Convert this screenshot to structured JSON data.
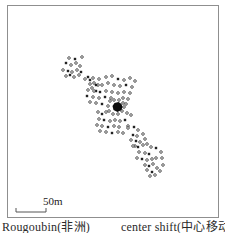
{
  "figure": {
    "caption_left": "Rougoubin(非洲)",
    "caption_right": "center shift(中心移动)",
    "scale_bar": {
      "label": "50m",
      "meters": 50,
      "x": 16,
      "y": 212,
      "length_px": 30,
      "tick_height_px": 4
    }
  },
  "colors": {
    "frame": "#8f8f8f",
    "marker_stroke": "#2e2e2e",
    "marker_fill_solid": "#222222",
    "blob": "#0d0d0d",
    "scalebar": "#555555",
    "text": "#2a2a2a"
  },
  "chart_data": {
    "type": "scatter",
    "title": "",
    "units": "image pixels",
    "marker_types": {
      "o": "open-ring structure",
      "s": "solid structure"
    },
    "center_blob": {
      "x": 117.5,
      "y": 107
    },
    "points": [
      [
        69,
        58,
        "o"
      ],
      [
        75,
        59,
        "s"
      ],
      [
        82,
        57,
        "o"
      ],
      [
        66,
        63,
        "s"
      ],
      [
        71,
        65,
        "o"
      ],
      [
        76,
        63,
        "o"
      ],
      [
        80,
        66,
        "o"
      ],
      [
        63,
        70,
        "o"
      ],
      [
        68,
        71,
        "s"
      ],
      [
        72,
        72,
        "o"
      ],
      [
        77,
        70,
        "o"
      ],
      [
        81,
        72,
        "s"
      ],
      [
        66,
        76,
        "o"
      ],
      [
        70,
        75,
        "s"
      ],
      [
        74,
        77,
        "o"
      ],
      [
        79,
        75,
        "o"
      ],
      [
        85,
        79,
        "o"
      ],
      [
        90,
        80,
        "s"
      ],
      [
        94,
        83,
        "o"
      ],
      [
        98,
        85,
        "o"
      ],
      [
        92,
        88,
        "o"
      ],
      [
        96,
        91,
        "s"
      ],
      [
        88,
        77,
        "s"
      ],
      [
        93,
        78,
        "o"
      ],
      [
        99,
        79,
        "o"
      ],
      [
        106,
        77,
        "o"
      ],
      [
        112,
        76,
        "o"
      ],
      [
        118,
        79,
        "s"
      ],
      [
        124,
        80,
        "o"
      ],
      [
        130,
        78,
        "o"
      ],
      [
        135,
        81,
        "o"
      ],
      [
        90,
        84,
        "o"
      ],
      [
        96,
        85,
        "s"
      ],
      [
        102,
        85,
        "o"
      ],
      [
        108,
        83,
        "o"
      ],
      [
        114,
        85,
        "o"
      ],
      [
        120,
        86,
        "o"
      ],
      [
        126,
        85,
        "s"
      ],
      [
        132,
        87,
        "o"
      ],
      [
        88,
        90,
        "o"
      ],
      [
        94,
        91,
        "o"
      ],
      [
        100,
        92,
        "s"
      ],
      [
        106,
        91,
        "o"
      ],
      [
        112,
        92,
        "o"
      ],
      [
        118,
        93,
        "o"
      ],
      [
        124,
        92,
        "o"
      ],
      [
        130,
        93,
        "o"
      ],
      [
        87,
        96,
        "s"
      ],
      [
        93,
        97,
        "o"
      ],
      [
        99,
        98,
        "o"
      ],
      [
        105,
        97,
        "s"
      ],
      [
        111,
        98,
        "o"
      ],
      [
        123,
        98,
        "o"
      ],
      [
        128,
        99,
        "o"
      ],
      [
        90,
        102,
        "o"
      ],
      [
        96,
        103,
        "o"
      ],
      [
        102,
        104,
        "s"
      ],
      [
        126,
        104,
        "o"
      ],
      [
        110,
        101,
        "o"
      ],
      [
        114,
        100,
        "o"
      ],
      [
        119,
        100,
        "o"
      ],
      [
        123,
        103,
        "o"
      ],
      [
        124,
        107,
        "o"
      ],
      [
        122,
        111,
        "o"
      ],
      [
        118,
        114,
        "o"
      ],
      [
        113,
        114,
        "o"
      ],
      [
        109,
        111,
        "o"
      ],
      [
        108,
        106,
        "o"
      ],
      [
        98,
        112,
        "o"
      ],
      [
        102,
        114,
        "s"
      ],
      [
        106,
        112,
        "o"
      ],
      [
        127,
        113,
        "o"
      ],
      [
        131,
        115,
        "o"
      ],
      [
        99,
        119,
        "o"
      ],
      [
        104,
        120,
        "s"
      ],
      [
        110,
        121,
        "o"
      ],
      [
        115,
        120,
        "o"
      ],
      [
        120,
        121,
        "o"
      ],
      [
        125,
        120,
        "s"
      ],
      [
        97,
        125,
        "o"
      ],
      [
        102,
        126,
        "o"
      ],
      [
        108,
        127,
        "s"
      ],
      [
        114,
        126,
        "o"
      ],
      [
        119,
        127,
        "o"
      ],
      [
        128,
        126,
        "o"
      ],
      [
        100,
        131,
        "o"
      ],
      [
        106,
        132,
        "o"
      ],
      [
        112,
        133,
        "s"
      ],
      [
        118,
        132,
        "o"
      ],
      [
        128,
        128,
        "o"
      ],
      [
        134,
        127,
        "s"
      ],
      [
        138,
        130,
        "o"
      ],
      [
        123,
        133,
        "o"
      ],
      [
        133,
        135,
        "s"
      ],
      [
        137,
        136,
        "o"
      ],
      [
        143,
        134,
        "o"
      ],
      [
        131,
        140,
        "o"
      ],
      [
        136,
        141,
        "s"
      ],
      [
        140,
        142,
        "o"
      ],
      [
        145,
        139,
        "o"
      ],
      [
        135,
        146,
        "o"
      ],
      [
        133,
        146,
        "o"
      ],
      [
        138,
        147,
        "s"
      ],
      [
        143,
        145,
        "o"
      ],
      [
        147,
        144,
        "o"
      ],
      [
        151,
        147,
        "o"
      ],
      [
        156,
        148,
        "s"
      ],
      [
        139,
        152,
        "o"
      ],
      [
        145,
        153,
        "o"
      ],
      [
        149,
        154,
        "s"
      ],
      [
        161,
        152,
        "o"
      ],
      [
        137,
        158,
        "o"
      ],
      [
        142,
        159,
        "s"
      ],
      [
        147,
        160,
        "o"
      ],
      [
        152,
        159,
        "o"
      ],
      [
        156,
        158,
        "o"
      ],
      [
        162,
        158,
        "o"
      ],
      [
        145,
        165,
        "o"
      ],
      [
        149,
        166,
        "s"
      ],
      [
        153,
        164,
        "o"
      ],
      [
        163,
        165,
        "o"
      ],
      [
        147,
        170,
        "o"
      ],
      [
        152,
        172,
        "s"
      ],
      [
        157,
        168,
        "o"
      ],
      [
        160,
        171,
        "o"
      ],
      [
        150,
        176,
        "o"
      ],
      [
        155,
        175,
        "o"
      ]
    ]
  }
}
